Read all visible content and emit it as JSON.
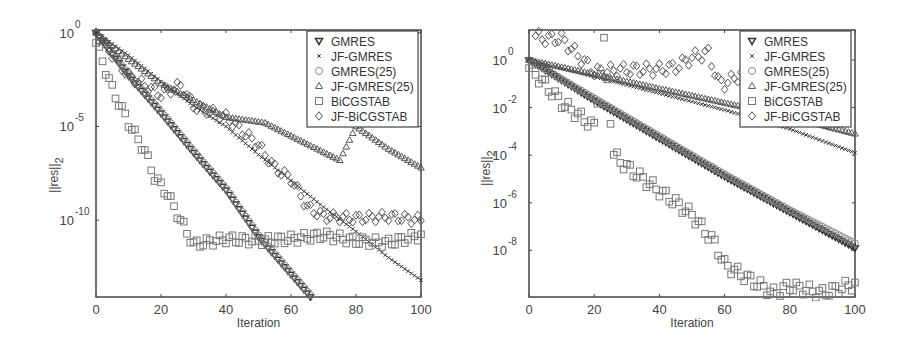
{
  "chart_data": [
    {
      "type": "scatter",
      "title": "",
      "xlabel": "Iteration",
      "ylabel": "||res||_2",
      "xlim": [
        0,
        100
      ],
      "ylim_log10": [
        -14.1,
        0.15
      ],
      "yscale": "log",
      "grid": false,
      "legend_position": "upper right",
      "x_ticks": [
        "0",
        "20",
        "40",
        "60",
        "80",
        "100"
      ],
      "y_ticks": [
        {
          "base": "10",
          "exp": "0"
        },
        {
          "base": "10",
          "exp": "-5"
        },
        {
          "base": "10",
          "exp": "-10"
        }
      ],
      "legend": [
        "GMRES",
        "JF-GMRES",
        "GMRES(25)",
        "JF-GMRES(25)",
        "BiCGSTAB",
        "JF-BiCGSTAB"
      ],
      "series": [
        {
          "name": "GMRES",
          "marker": "triangle-down",
          "x": [
            0,
            10,
            20,
            30,
            40,
            50,
            60,
            66
          ],
          "log10_y": [
            0,
            -2.3,
            -4.3,
            -6.4,
            -8.4,
            -10.9,
            -12.9,
            -14.1
          ]
        },
        {
          "name": "JF-GMRES",
          "marker": "x",
          "x": [
            0,
            10,
            20,
            30,
            40,
            50,
            60,
            70,
            80,
            90,
            100
          ],
          "log10_y": [
            0,
            -1.2,
            -2.6,
            -3.9,
            -5.0,
            -6.5,
            -7.9,
            -9.3,
            -10.6,
            -12.0,
            -13.2
          ]
        },
        {
          "name": "GMRES(25)",
          "marker": "circle",
          "x": [
            0,
            10,
            20,
            30,
            40,
            50,
            60,
            66
          ],
          "log10_y": [
            0,
            -2.2,
            -4.2,
            -6.3,
            -8.3,
            -10.8,
            -12.8,
            -14.0
          ]
        },
        {
          "name": "JF-GMRES(25)",
          "marker": "triangle-up",
          "x": [
            0,
            10,
            20,
            30,
            40,
            52,
            60,
            75,
            80,
            90,
            100
          ],
          "log10_y": [
            0,
            -1.4,
            -2.7,
            -3.6,
            -4.5,
            -4.8,
            -5.5,
            -6.8,
            -5.0,
            -6.2,
            -7.2
          ]
        },
        {
          "name": "BiCGSTAB",
          "marker": "square",
          "x": [
            0,
            5,
            10,
            15,
            18,
            22,
            26,
            30,
            40,
            50,
            60,
            70,
            80,
            90,
            100
          ],
          "log10_y": [
            -0.5,
            -3.0,
            -4.8,
            -6.3,
            -7.7,
            -8.6,
            -10.0,
            -11.3,
            -11.0,
            -11.1,
            -11.0,
            -10.8,
            -11.1,
            -11.2,
            -10.8
          ]
        },
        {
          "name": "JF-BiCGSTAB",
          "marker": "diamond",
          "x": [
            0,
            10,
            20,
            26,
            30,
            40,
            50,
            55,
            60,
            65,
            70,
            80,
            90,
            100
          ],
          "log10_y": [
            0,
            -2.3,
            -3.3,
            -2.8,
            -3.9,
            -4.5,
            -6.0,
            -7.2,
            -7.8,
            -9.3,
            -9.8,
            -9.9,
            -9.8,
            -10.0
          ]
        }
      ]
    },
    {
      "type": "scatter",
      "title": "",
      "xlabel": "Iteration",
      "ylabel": "||res||_2",
      "xlim": [
        0,
        100
      ],
      "ylim_log10": [
        -9.96,
        1.26
      ],
      "yscale": "log",
      "grid": false,
      "legend_position": "upper right",
      "x_ticks": [
        "0",
        "20",
        "40",
        "60",
        "80",
        "100"
      ],
      "y_ticks": [
        {
          "base": "10",
          "exp": "0"
        },
        {
          "base": "10",
          "exp": "-2"
        },
        {
          "base": "10",
          "exp": "-4"
        },
        {
          "base": "10",
          "exp": "-6"
        },
        {
          "base": "10",
          "exp": "-8"
        }
      ],
      "legend": [
        "GMRES",
        "JF-GMRES",
        "GMRES(25)",
        "JF-GMRES(25)",
        "BiCGSTAB",
        "JF-BiCGSTAB"
      ],
      "series": [
        {
          "name": "GMRES",
          "marker": "triangle-down",
          "x": [
            0,
            20,
            40,
            60,
            80,
            100
          ],
          "log10_y": [
            0,
            -1.7,
            -3.3,
            -4.9,
            -6.4,
            -7.9
          ]
        },
        {
          "name": "JF-GMRES",
          "marker": "x",
          "x": [
            0,
            20,
            40,
            60,
            80,
            100
          ],
          "log10_y": [
            0,
            -0.7,
            -1.4,
            -2.1,
            -2.9,
            -3.9
          ]
        },
        {
          "name": "GMRES(25)",
          "marker": "circle",
          "x": [
            0,
            20,
            40,
            60,
            80,
            100
          ],
          "log10_y": [
            0,
            -1.6,
            -3.2,
            -4.8,
            -6.3,
            -7.7
          ]
        },
        {
          "name": "JF-GMRES(25)",
          "marker": "triangle-up",
          "x": [
            0,
            20,
            40,
            60,
            80,
            100
          ],
          "log10_y": [
            0,
            -0.6,
            -1.2,
            -1.8,
            -2.4,
            -3.1
          ]
        },
        {
          "name": "BiCGSTAB",
          "marker": "square",
          "x": [
            0,
            10,
            20,
            23,
            26,
            30,
            40,
            50,
            57,
            60,
            70,
            75,
            80,
            90,
            100
          ],
          "log10_y": [
            -0.3,
            -1.8,
            -2.8,
            0.7,
            -4.0,
            -4.5,
            -5.5,
            -6.5,
            -7.7,
            -8.6,
            -9.4,
            -9.8,
            -9.5,
            -9.8,
            -9.4
          ]
        },
        {
          "name": "JF-BiCGSTAB",
          "marker": "diamond",
          "x": [
            2,
            5,
            10,
            20,
            30,
            40,
            45,
            50,
            55,
            58,
            60,
            65,
            70
          ],
          "log10_y": [
            1.0,
            0.9,
            0.9,
            -0.5,
            -0.4,
            -0.4,
            -0.3,
            0.1,
            0.3,
            -0.9,
            -1.0,
            -0.6,
            -0.9
          ]
        }
      ]
    }
  ]
}
